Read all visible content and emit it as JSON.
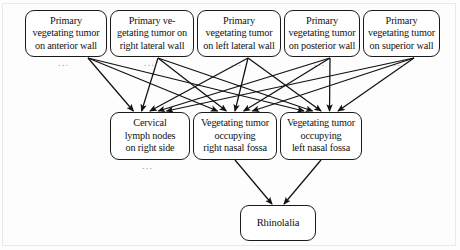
{
  "diagram": {
    "type": "causal-flow-graph",
    "title_text": "",
    "orientation": "top-to-bottom",
    "colors": {
      "node_border": "#1b1b1b",
      "node_fill": "#ffffff",
      "edge": "#111111",
      "background": "#fdfdfd",
      "ellipsis": "#9a9a9a"
    },
    "layers": [
      {
        "id": "causes",
        "index": 0,
        "nodes": [
          {
            "id": "n1",
            "lines": [
              "Primary",
              "vegetating tumor",
              "on anterior wall"
            ],
            "ellipsis": "..."
          },
          {
            "id": "n2",
            "lines": [
              "Primary ve-",
              "getating tumor on",
              "right lateral wall"
            ],
            "ellipsis": "..."
          },
          {
            "id": "n3",
            "lines": [
              "Primary",
              "vegetating tumor",
              "on left lateral wall"
            ],
            "ellipsis": "..."
          },
          {
            "id": "n4",
            "lines": [
              "Primary",
              "vegetating tumor",
              "on posterior wall"
            ],
            "ellipsis": "..."
          },
          {
            "id": "n5",
            "lines": [
              "Primary",
              "vegetating tumor",
              "on superior wall"
            ],
            "ellipsis": "..."
          }
        ]
      },
      {
        "id": "intermediates",
        "index": 1,
        "nodes": [
          {
            "id": "m1",
            "lines": [
              "Cervical",
              "lymph nodes",
              "on right side"
            ],
            "ellipsis": "..."
          },
          {
            "id": "m2",
            "lines": [
              "Vegetating tumor",
              "occupying",
              "right nasal fossa"
            ],
            "ellipsis": ""
          },
          {
            "id": "m3",
            "lines": [
              "Vegetating tumor",
              "occupying",
              "left nasal fossa"
            ],
            "ellipsis": ""
          }
        ]
      },
      {
        "id": "outcome",
        "index": 2,
        "nodes": [
          {
            "id": "b1",
            "lines": [
              "Rhinolalia"
            ],
            "ellipsis": ""
          }
        ]
      }
    ],
    "edges": [
      {
        "from": "n1",
        "to": "m1"
      },
      {
        "from": "n1",
        "to": "m2"
      },
      {
        "from": "n1",
        "to": "m3"
      },
      {
        "from": "n2",
        "to": "m1"
      },
      {
        "from": "n2",
        "to": "m2"
      },
      {
        "from": "n2",
        "to": "m3"
      },
      {
        "from": "n3",
        "to": "m1"
      },
      {
        "from": "n3",
        "to": "m2"
      },
      {
        "from": "n3",
        "to": "m3"
      },
      {
        "from": "n4",
        "to": "m1"
      },
      {
        "from": "n4",
        "to": "m2"
      },
      {
        "from": "n4",
        "to": "m3"
      },
      {
        "from": "n5",
        "to": "m1"
      },
      {
        "from": "n5",
        "to": "m2"
      },
      {
        "from": "n5",
        "to": "m3"
      },
      {
        "from": "m2",
        "to": "b1"
      },
      {
        "from": "m3",
        "to": "b1"
      }
    ],
    "geometry": {
      "top_row": [
        {
          "x": 25,
          "y": 10,
          "w": 82,
          "h": 47
        },
        {
          "x": 110,
          "y": 10,
          "w": 84,
          "h": 47
        },
        {
          "x": 197,
          "y": 10,
          "w": 84,
          "h": 47
        },
        {
          "x": 284,
          "y": 10,
          "w": 76,
          "h": 47
        },
        {
          "x": 363,
          "y": 10,
          "w": 77,
          "h": 47
        }
      ],
      "mid_row": [
        {
          "x": 110,
          "y": 112,
          "w": 80,
          "h": 48
        },
        {
          "x": 193,
          "y": 112,
          "w": 84,
          "h": 48
        },
        {
          "x": 280,
          "y": 112,
          "w": 82,
          "h": 48
        }
      ],
      "bottom_row": [
        {
          "x": 240,
          "y": 205,
          "w": 76,
          "h": 36
        }
      ],
      "edge_origins": {
        "n1": {
          "x": 88,
          "y": 58
        },
        "n2": {
          "x": 158,
          "y": 58
        },
        "n3": {
          "x": 248,
          "y": 58
        },
        "n4": {
          "x": 330,
          "y": 58
        },
        "n5": {
          "x": 414,
          "y": 58
        }
      },
      "edge_targets": {
        "m1": [
          {
            "x": 138,
            "y": 111
          },
          {
            "x": 149,
            "y": 111
          },
          {
            "x": 160,
            "y": 111
          }
        ],
        "m2": [
          {
            "x": 222,
            "y": 111
          },
          {
            "x": 233,
            "y": 111
          },
          {
            "x": 244,
            "y": 111
          }
        ],
        "m3": [
          {
            "x": 307,
            "y": 111
          },
          {
            "x": 318,
            "y": 111
          },
          {
            "x": 329,
            "y": 111
          }
        ]
      },
      "outcome_targets": [
        {
          "x": 272,
          "y": 204
        },
        {
          "x": 284,
          "y": 204
        }
      ]
    }
  }
}
